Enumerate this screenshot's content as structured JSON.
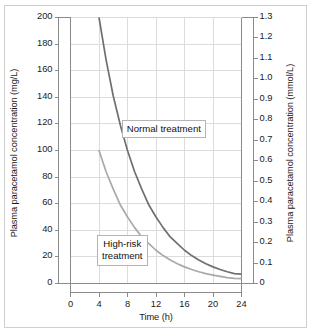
{
  "figure": {
    "background_color": "#ffffff",
    "border_color": "#cfcfcf"
  },
  "chart_data": {
    "type": "line",
    "title": "",
    "subtitle": "",
    "xlabel": "Time (h)",
    "ylabel": "Plasma paracetamol concentration (mg/L)",
    "ylabel_right": "Plasma paracetamol concentration (mmol/L)",
    "xlim": [
      0,
      24
    ],
    "ylim": [
      0,
      200
    ],
    "ylim_right": [
      0,
      1.3
    ],
    "xticks": [
      0,
      4,
      8,
      12,
      16,
      20,
      24
    ],
    "xtick_labels": [
      "0",
      "4",
      "8",
      "12",
      "16",
      "20",
      "24"
    ],
    "yticks": [
      0,
      20,
      40,
      60,
      80,
      100,
      120,
      140,
      160,
      180,
      200
    ],
    "ytick_labels": [
      "0",
      "20",
      "40",
      "60",
      "80",
      "100",
      "120",
      "140",
      "160",
      "180",
      "200"
    ],
    "yticks_right": [
      0,
      0.1,
      0.2,
      0.3,
      0.4,
      0.5,
      0.6,
      0.7,
      0.8,
      0.9,
      1.0,
      1.1,
      1.2,
      1.3
    ],
    "ytick_labels_right": [
      "0",
      "0.1",
      "0.2",
      "0.3",
      "0.4",
      "0.5",
      "0.6",
      "0.7",
      "0.8",
      "0.9",
      "1.0",
      "1.1",
      "1.2",
      "1.3"
    ],
    "grid": true,
    "grid_color": "#dcdcdc",
    "legend": "none",
    "series": [
      {
        "name": "Normal treatment",
        "color": "#6f6f6f",
        "line_width": 1.7,
        "x": [
          3.6,
          4,
          5,
          6,
          7,
          8,
          9,
          10,
          11,
          12,
          13,
          14,
          15,
          16,
          17,
          18,
          19,
          20,
          21,
          22,
          23,
          24
        ],
        "values": [
          220,
          200,
          168,
          141,
          119,
          100,
          84,
          71,
          59,
          50,
          42,
          35,
          30,
          25,
          21,
          17.7,
          14.9,
          12.5,
          10.5,
          8.8,
          7.4,
          7.0
        ]
      },
      {
        "name": "High-risk treatment",
        "color": "#a9a9a9",
        "line_width": 1.7,
        "x": [
          4,
          5,
          6,
          7,
          8,
          9,
          10,
          11,
          12,
          13,
          14,
          15,
          16,
          17,
          18,
          19,
          20,
          21,
          22,
          23,
          24
        ],
        "values": [
          100,
          84,
          71,
          59,
          50,
          42,
          35,
          30,
          25,
          21,
          17.7,
          14.9,
          12.5,
          10.5,
          8.8,
          7.4,
          6.3,
          5.3,
          4.4,
          3.9,
          3.6
        ]
      }
    ],
    "annotations": [
      {
        "text": "Normal treatment",
        "x_data": 13.1,
        "y_data": 116
      },
      {
        "text": "High-risk\ntreatment",
        "x_data": 7.3,
        "y_data": 25
      }
    ]
  }
}
